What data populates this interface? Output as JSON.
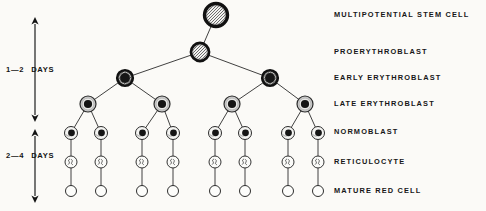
{
  "figure": {
    "background_color": "#fbfaf7",
    "ink_color": "#171717"
  },
  "stage_labels": [
    {
      "text": "MULTIPOTENTIAL STEM CELL",
      "y": 11
    },
    {
      "text": "PROERYTHROBLAST",
      "y": 48
    },
    {
      "text": "EARLY ERYTHROBLAST",
      "y": 74
    },
    {
      "text": "LATE ERYTHROBLAST",
      "y": 100
    },
    {
      "text": "NORMOBLAST",
      "y": 128
    },
    {
      "text": "RETICULOCYTE",
      "y": 158
    },
    {
      "text": "MATURE RED CELL",
      "y": 187
    }
  ],
  "duration_labels": [
    {
      "number": "1—2",
      "unit": "DAYS",
      "y": 66,
      "arrow_top": 17,
      "arrow_bottom": 122
    },
    {
      "number": "2—4",
      "unit": "DAYS",
      "y": 152,
      "arrow_top": 129,
      "arrow_bottom": 203
    }
  ],
  "chart_data": {
    "type": "diagram",
    "tiers": [
      {
        "name": "MULTIPOTENTIAL STEM CELL",
        "count": 1,
        "y": 15,
        "radius": 11.5,
        "style": "thick-ring-crosshatch",
        "x": [
          216
        ]
      },
      {
        "name": "PROERYTHROBLAST",
        "count": 1,
        "y": 52,
        "radius": 9,
        "style": "thick-ring-crosshatch",
        "x": [
          200
        ]
      },
      {
        "name": "EARLY ERYTHROBLAST",
        "count": 2,
        "y": 78,
        "radius": 8,
        "style": "thick-ring-dark-core",
        "x": [
          125,
          270
        ]
      },
      {
        "name": "LATE ERYTHROBLAST",
        "count": 4,
        "y": 104,
        "radius": 8,
        "style": "gray-halo-dark-core",
        "x": [
          88,
          162,
          232,
          305
        ]
      },
      {
        "name": "NORMOBLAST",
        "count": 8,
        "y": 133,
        "radius": 6.5,
        "style": "thin-ring-small-nucleus",
        "x": [
          71,
          101,
          142,
          173,
          215,
          245,
          288,
          318
        ]
      },
      {
        "name": "RETICULOCYTE",
        "count": 8,
        "y": 162,
        "radius": 6,
        "style": "thin-ring-reticulum",
        "x": [
          71,
          101,
          142,
          173,
          215,
          245,
          288,
          318
        ]
      },
      {
        "name": "MATURE RED CELL",
        "count": 8,
        "y": 191,
        "radius": 5.5,
        "style": "open-circle",
        "x": [
          71,
          101,
          142,
          173,
          215,
          245,
          288,
          318
        ]
      }
    ],
    "edges": [
      [
        216,
        15,
        200,
        52
      ],
      [
        200,
        52,
        125,
        78
      ],
      [
        200,
        52,
        270,
        78
      ],
      [
        125,
        78,
        88,
        104
      ],
      [
        125,
        78,
        162,
        104
      ],
      [
        270,
        78,
        232,
        104
      ],
      [
        270,
        78,
        305,
        104
      ],
      [
        88,
        104,
        71,
        133
      ],
      [
        88,
        104,
        101,
        133
      ],
      [
        162,
        104,
        142,
        133
      ],
      [
        162,
        104,
        173,
        133
      ],
      [
        232,
        104,
        215,
        133
      ],
      [
        232,
        104,
        245,
        133
      ],
      [
        305,
        104,
        288,
        133
      ],
      [
        305,
        104,
        318,
        133
      ],
      [
        71,
        133,
        71,
        162
      ],
      [
        101,
        133,
        101,
        162
      ],
      [
        142,
        133,
        142,
        162
      ],
      [
        173,
        133,
        173,
        162
      ],
      [
        215,
        133,
        215,
        162
      ],
      [
        245,
        133,
        245,
        162
      ],
      [
        288,
        133,
        288,
        162
      ],
      [
        318,
        133,
        318,
        162
      ],
      [
        71,
        162,
        71,
        191
      ],
      [
        101,
        162,
        101,
        191
      ],
      [
        142,
        162,
        142,
        191
      ],
      [
        173,
        162,
        173,
        191
      ],
      [
        215,
        162,
        215,
        191
      ],
      [
        245,
        162,
        245,
        191
      ],
      [
        288,
        162,
        288,
        191
      ],
      [
        318,
        162,
        318,
        191
      ]
    ],
    "timeline_axis_x": 35
  }
}
